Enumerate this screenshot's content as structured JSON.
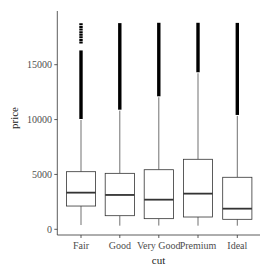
{
  "chart_data": {
    "type": "boxplot",
    "title": "",
    "xlabel": "cut",
    "ylabel": "price",
    "categories": [
      "Fair",
      "Good",
      "Very Good",
      "Premium",
      "Ideal"
    ],
    "yticks": [
      0,
      5000,
      10000,
      15000
    ],
    "ylim": [
      -500,
      19000
    ],
    "grid": false,
    "legend": null,
    "boxes": [
      {
        "category": "Fair",
        "whisker_low": 390,
        "q1": 2120,
        "median": 3340,
        "q3": 5250,
        "whisker_high": 9960,
        "outlier_max": 18770,
        "outlier_gap": [
          16300,
          16900
        ]
      },
      {
        "category": "Good",
        "whisker_low": 330,
        "q1": 1240,
        "median": 3130,
        "q3": 5100,
        "whisker_high": 10810,
        "outlier_max": 18790
      },
      {
        "category": "Very Good",
        "whisker_low": 340,
        "q1": 970,
        "median": 2700,
        "q3": 5430,
        "whisker_high": 12030,
        "outlier_max": 18820
      },
      {
        "category": "Premium",
        "whisker_low": 330,
        "q1": 1120,
        "median": 3250,
        "q3": 6380,
        "whisker_high": 14220,
        "outlier_max": 18820
      },
      {
        "category": "Ideal",
        "whisker_low": 330,
        "q1": 910,
        "median": 1880,
        "q3": 4740,
        "whisker_high": 10330,
        "outlier_max": 18810
      }
    ]
  },
  "colors": {
    "box_stroke": "#333333",
    "outlier": "#000000",
    "axis": "#333333",
    "text": "#4d4d4d"
  }
}
